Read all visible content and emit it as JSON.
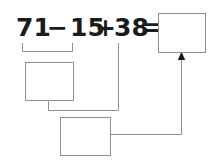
{
  "worksheet": {
    "title": "Arithmetic expression worksheet",
    "expression": {
      "operand_1": "71",
      "operator_1": "−",
      "operand_2": "15",
      "operator_2": "+",
      "operand_3": "38",
      "equals": "=",
      "full_text": "71 − 15 + 38 ="
    },
    "answer_box": {
      "label": "answer",
      "value": "",
      "placeholder": ""
    },
    "work_boxes": [
      {
        "label": "first-step",
        "value": "",
        "placeholder": "",
        "source": "71 − 15"
      },
      {
        "label": "second-step",
        "value": "",
        "placeholder": "",
        "source": "first-step + 38"
      }
    ],
    "colors": {
      "text": "#1b1b1b",
      "line": "#8f8f8f",
      "box_fill": "#ffffff",
      "background": "#ffffff",
      "arrow": "#1b1b1b"
    }
  }
}
